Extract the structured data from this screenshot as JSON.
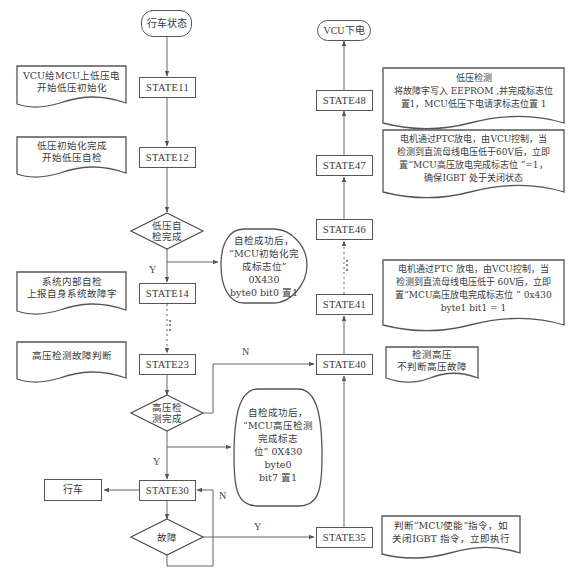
{
  "diagram": {
    "start": "行车状态",
    "end": "VCU下电",
    "left_states": [
      "STATE11",
      "STATE12",
      "STATE14",
      "STATE23",
      "STATE30"
    ],
    "right_states": [
      "STATE48",
      "STATE47",
      "STATE46",
      "STATE41",
      "STATE40",
      "STATE35"
    ],
    "decisions": {
      "lv_check": [
        "低压自",
        "检完成"
      ],
      "hv_check": [
        "高压检",
        "测完成"
      ],
      "fault": [
        "故障"
      ]
    },
    "drive": "行车",
    "edge_labels": {
      "y_lv": "Y",
      "y_hv": "Y",
      "n_hv": "N",
      "n_fault": "N",
      "y_fault": "Y"
    },
    "notes_left": {
      "state11": [
        "VCU给MCU上低压电",
        "开始低压初始化"
      ],
      "state12": [
        "低压初始化完成",
        "开始低压自检"
      ],
      "state14": [
        "系统内部自检",
        "上报自身系统故障字"
      ],
      "state23": [
        "高压检测故障判断"
      ]
    },
    "notes_oval": {
      "lv_success": [
        "自检成功后，",
        "“MCU初始化完",
        "成标志位” 0X430",
        "byte0 bit0 置1"
      ],
      "hv_success": [
        "自检成功后，",
        "“MCU高压检测",
        "完成标志",
        "位” 0X430 byte0",
        "bit7 置1"
      ]
    },
    "notes_right": {
      "state48": [
        "低压检测",
        "将故障字写入 EEPROM ,并完成标志位",
        "置1，MCU低压下电请求标志位置 1"
      ],
      "state47": [
        "电机通过PTC放电，由VCU控制，当",
        "检测到直流母线电压低于60V后，立即",
        "置“MCU高压放电完成标志位 ”=1，",
        "确保IGBT 处于关闭状态"
      ],
      "state41": [
        "电机通过PTC 放电，由VCU控制，当",
        "检测到直流母线电压低于 60V后，立即",
        "置“MCU高压放电完成标志位 ” 0x430",
        "byte1 bit1 = 1"
      ],
      "state40": [
        "检测高压",
        "不判断高压故障"
      ],
      "state35": [
        "判断“MCU使能”指令，如",
        "关闭IGBT 指令，立即执行"
      ]
    },
    "ellipsis": "⋮"
  }
}
